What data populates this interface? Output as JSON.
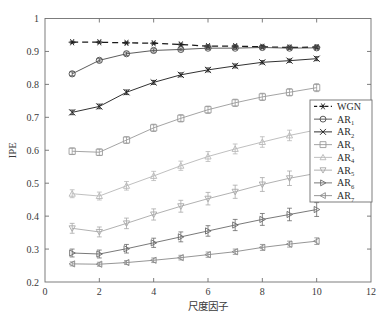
{
  "chart_data": {
    "type": "line",
    "title": "",
    "xlabel": "尺度因子",
    "ylabel": "IPE",
    "xlim": [
      0,
      12
    ],
    "ylim": [
      0.2,
      1
    ],
    "xticks": [
      0,
      2,
      4,
      6,
      8,
      10,
      12
    ],
    "xtick_labels": [
      "0",
      "2",
      "4",
      "6",
      "8",
      "10",
      "12"
    ],
    "yticks": [
      0.2,
      0.3,
      0.4,
      0.5,
      0.6,
      0.7,
      0.8,
      0.9,
      1
    ],
    "ytick_labels": [
      "0.2",
      "0.3",
      "0.4",
      "0.5",
      "0.6",
      "0.7",
      "0.8",
      "0.9",
      "1"
    ],
    "grid": false,
    "legend_position": "right",
    "x": [
      1,
      2,
      3,
      4,
      5,
      6,
      7,
      8,
      9,
      10
    ],
    "series": [
      {
        "name": "WGN",
        "label": "WGN",
        "marker": "asterisk",
        "linestyle": "dashed",
        "color": "#1a1a1a",
        "values": [
          0.928,
          0.928,
          0.926,
          0.925,
          0.921,
          0.916,
          0.916,
          0.914,
          0.912,
          0.913
        ],
        "errors": [
          0.003,
          0.003,
          0.003,
          0.003,
          0.004,
          0.004,
          0.004,
          0.004,
          0.004,
          0.004
        ]
      },
      {
        "name": "AR1",
        "label": "AR",
        "sub": "1",
        "marker": "circle",
        "linestyle": "solid",
        "color": "#4a4a4a",
        "values": [
          0.832,
          0.873,
          0.893,
          0.903,
          0.906,
          0.91,
          0.91,
          0.912,
          0.91,
          0.911
        ],
        "errors": [
          0.006,
          0.005,
          0.005,
          0.005,
          0.004,
          0.004,
          0.004,
          0.004,
          0.004,
          0.004
        ]
      },
      {
        "name": "AR2",
        "label": "AR",
        "sub": "2",
        "marker": "x",
        "linestyle": "solid",
        "color": "#1a1a1a",
        "values": [
          0.715,
          0.733,
          0.776,
          0.806,
          0.829,
          0.844,
          0.856,
          0.867,
          0.872,
          0.878
        ],
        "errors": [
          0.007,
          0.007,
          0.007,
          0.006,
          0.006,
          0.006,
          0.006,
          0.005,
          0.005,
          0.006
        ]
      },
      {
        "name": "AR3",
        "label": "AR",
        "sub": "3",
        "marker": "square",
        "linestyle": "solid",
        "color": "#9a9a9a",
        "values": [
          0.597,
          0.594,
          0.631,
          0.668,
          0.697,
          0.723,
          0.744,
          0.762,
          0.776,
          0.79
        ],
        "errors": [
          0.01,
          0.01,
          0.01,
          0.011,
          0.011,
          0.011,
          0.011,
          0.011,
          0.011,
          0.012
        ]
      },
      {
        "name": "AR4",
        "label": "AR",
        "sub": "4",
        "marker": "triangle-up",
        "linestyle": "solid",
        "color": "#b8b8b8",
        "values": [
          0.468,
          0.461,
          0.492,
          0.522,
          0.553,
          0.581,
          0.604,
          0.625,
          0.645,
          0.662
        ],
        "errors": [
          0.012,
          0.012,
          0.013,
          0.014,
          0.014,
          0.015,
          0.015,
          0.016,
          0.016,
          0.017
        ]
      },
      {
        "name": "AR5",
        "label": "AR",
        "sub": "5",
        "marker": "triangle-down",
        "linestyle": "solid",
        "color": "#a8a8a8",
        "values": [
          0.363,
          0.352,
          0.378,
          0.405,
          0.43,
          0.453,
          0.474,
          0.496,
          0.515,
          0.53
        ],
        "errors": [
          0.015,
          0.015,
          0.016,
          0.017,
          0.018,
          0.019,
          0.02,
          0.021,
          0.022,
          0.023
        ]
      },
      {
        "name": "AR6",
        "label": "AR",
        "sub": "6",
        "marker": "triangle-right",
        "linestyle": "solid",
        "color": "#6a6a6a",
        "values": [
          0.288,
          0.285,
          0.301,
          0.319,
          0.337,
          0.355,
          0.373,
          0.39,
          0.405,
          0.42
        ],
        "errors": [
          0.012,
          0.012,
          0.013,
          0.014,
          0.015,
          0.016,
          0.017,
          0.018,
          0.019,
          0.021
        ]
      },
      {
        "name": "AR7",
        "label": "AR",
        "sub": "7",
        "marker": "triangle-left",
        "linestyle": "solid",
        "color": "#8a8a8a",
        "values": [
          0.255,
          0.254,
          0.259,
          0.266,
          0.274,
          0.283,
          0.292,
          0.305,
          0.315,
          0.324
        ],
        "errors": [
          0.006,
          0.006,
          0.006,
          0.007,
          0.007,
          0.008,
          0.008,
          0.009,
          0.009,
          0.01
        ]
      }
    ]
  }
}
